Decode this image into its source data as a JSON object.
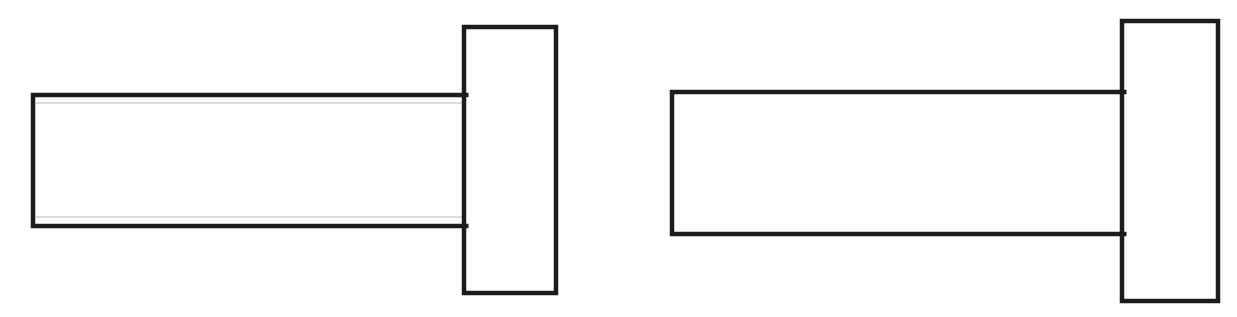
{
  "figure": {
    "title": "",
    "background_color": "#ffffff",
    "stroke_color": "#1c1c1c",
    "inner_line_color": "#b9b9b9",
    "canvas": {
      "width": 1237,
      "height": 317
    },
    "caption": ""
  },
  "chart_data": {
    "type": "table",
    "title": "",
    "xlabel": "",
    "ylabel": "",
    "parts": [
      {
        "id": "left-assembly",
        "label": "Left T-profile assembly",
        "shaft": {
          "label": "Left shaft body",
          "x": 33,
          "y": 95,
          "width": 433,
          "height": 131,
          "stroke_width": 4.5,
          "has_inner_lines": true,
          "inner_lines": [
            {
              "label": "Upper inner edge line",
              "x1": 36,
              "y1": 103,
              "x2": 466,
              "y2": 103,
              "stroke_width": 1.2
            },
            {
              "label": "Lower inner edge line",
              "x1": 36,
              "y1": 217,
              "x2": 466,
              "y2": 217,
              "stroke_width": 1.2
            }
          ]
        },
        "head": {
          "label": "Left head flange",
          "x": 464,
          "y": 27,
          "width": 92,
          "height": 266,
          "stroke_width": 4.5
        }
      },
      {
        "id": "right-assembly",
        "label": "Right T-profile assembly",
        "shaft": {
          "label": "Right shaft body",
          "x": 672,
          "y": 92,
          "width": 452,
          "height": 142,
          "stroke_width": 4.5,
          "has_inner_lines": false,
          "inner_lines": []
        },
        "head": {
          "label": "Right head flange",
          "x": 1122,
          "y": 21,
          "width": 96,
          "height": 280,
          "stroke_width": 4.5
        }
      }
    ],
    "annotations": [],
    "legend": []
  }
}
